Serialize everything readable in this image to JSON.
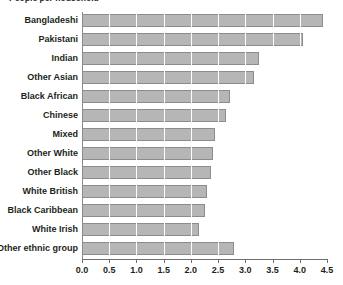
{
  "chart_data": {
    "type": "bar",
    "orientation": "horizontal",
    "title": "People per household",
    "xlabel": "",
    "ylabel": "",
    "xlim": [
      0.0,
      4.5
    ],
    "xticks": [
      "0.0",
      "0.5",
      "1.0",
      "1.5",
      "2.0",
      "2.5",
      "3.0",
      "3.5",
      "4.0",
      "4.5"
    ],
    "xtick_values": [
      0.0,
      0.5,
      1.0,
      1.5,
      2.0,
      2.5,
      3.0,
      3.5,
      4.0,
      4.5
    ],
    "grid": true,
    "grid_axis": "x",
    "legend": false,
    "categories": [
      "Bangladeshi",
      "Pakistani",
      "Indian",
      "Other Asian",
      "Black African",
      "Chinese",
      "Mixed",
      "Other White",
      "Other Black",
      "White British",
      "Black Caribbean",
      "White Irish",
      "Other ethnic group"
    ],
    "values": [
      4.43,
      4.06,
      3.26,
      3.16,
      2.72,
      2.65,
      2.44,
      2.41,
      2.37,
      2.3,
      2.25,
      2.15,
      2.79
    ],
    "bar_color": "#b6b6b6",
    "bar_edge_color": "#8c8c8c",
    "axis_color": "#6f6f6f",
    "gridline_color": "#9a9a9a",
    "background": "#ffffff"
  }
}
